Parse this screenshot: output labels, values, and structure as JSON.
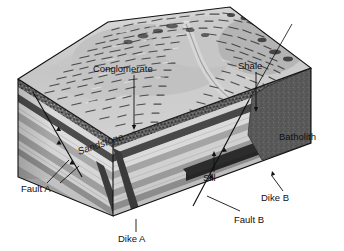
{
  "figure": {
    "type": "geologic-block-diagram",
    "background_color": "#ffffff"
  },
  "labels": {
    "conglomerate": "Conglomerate",
    "shale": "Shale",
    "sandstone": "Sandstone",
    "batholith": "Batholith",
    "sill": "Sill",
    "fault_a": "Fault A",
    "fault_b": "Fault B",
    "dike_a": "Dike A",
    "dike_b": "Dike B"
  },
  "features": [
    {
      "name": "Conglomerate",
      "kind": "sedimentary-layer",
      "color": "#5e5e5e"
    },
    {
      "name": "Shale",
      "kind": "sedimentary-layer",
      "color": "#4a4a4a"
    },
    {
      "name": "Sandstone",
      "kind": "sedimentary-layer",
      "color": "#c9c9c9"
    },
    {
      "name": "Batholith",
      "kind": "igneous-intrusion",
      "color": "#575757"
    },
    {
      "name": "Sill",
      "kind": "igneous-intrusion",
      "color": "#2b2b2b"
    },
    {
      "name": "Dike A",
      "kind": "igneous-intrusion",
      "color": "#3a3a3a"
    },
    {
      "name": "Dike B",
      "kind": "igneous-intrusion",
      "color": "#2f2f2f"
    },
    {
      "name": "Fault A",
      "kind": "fault",
      "color": "#111111"
    },
    {
      "name": "Fault B",
      "kind": "fault",
      "color": "#111111"
    }
  ],
  "colors": {
    "outline": "#111111",
    "terrain_light": "#d7d7d7",
    "terrain_mid": "#ababab",
    "terrain_dark": "#6f6f6f",
    "layer_light": "#dcdcdc",
    "layer_pale": "#cccccc",
    "layer_mid": "#b0b0b0",
    "layer_medgray": "#9a9a9a",
    "layer_dark": "#6a6a6a",
    "layer_darker": "#4e4e4e",
    "batholith": "#5a5a5a",
    "dike": "#323232",
    "label_text": "#111111"
  }
}
